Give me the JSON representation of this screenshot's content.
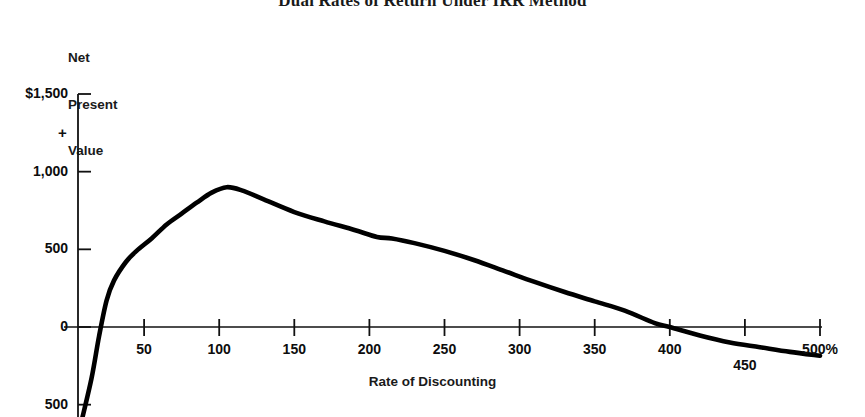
{
  "chart_data": {
    "type": "line",
    "title": "Dual Rates of Return Under IRR Method",
    "subtitle": "",
    "xlabel": "Rate of Discounting",
    "ylabel": "Net Present Value",
    "ylabel_lines": [
      "Net",
      "Present",
      "Value"
    ],
    "xlim": [
      0,
      500
    ],
    "ylim": [
      -600,
      1500
    ],
    "grid": false,
    "legend": null,
    "x_unit": "%",
    "y_unit": "$",
    "xticks": [
      {
        "value": 50,
        "label": "50"
      },
      {
        "value": 100,
        "label": "100"
      },
      {
        "value": 150,
        "label": "150"
      },
      {
        "value": 200,
        "label": "200"
      },
      {
        "value": 250,
        "label": "250"
      },
      {
        "value": 300,
        "label": "300"
      },
      {
        "value": 350,
        "label": "350"
      },
      {
        "value": 400,
        "label": "400"
      },
      {
        "value": 450,
        "label": "450"
      },
      {
        "value": 500,
        "label": "500%"
      }
    ],
    "yticks": [
      {
        "value": 1500,
        "label": "$1,500"
      },
      {
        "value": 1000,
        "label": "1,000"
      },
      {
        "value": 500,
        "label": "500"
      },
      {
        "value": 0,
        "label": "0"
      },
      {
        "value": -500,
        "label": "500"
      }
    ],
    "annotations": [
      {
        "text": "+",
        "value": 1250,
        "note": "positive region marker on y-axis"
      }
    ],
    "series": [
      {
        "name": "Net Present Value",
        "color": "#000000",
        "x": [
          8,
          15,
          20,
          25,
          30,
          38,
          45,
          55,
          65,
          75,
          85,
          95,
          105,
          115,
          130,
          150,
          170,
          190,
          205,
          215,
          230,
          250,
          270,
          290,
          310,
          330,
          350,
          370,
          390,
          400,
          420,
          440,
          460,
          480,
          500
        ],
        "y": [
          -620,
          -330,
          -60,
          170,
          300,
          420,
          490,
          570,
          660,
          730,
          800,
          865,
          900,
          880,
          820,
          740,
          680,
          625,
          580,
          570,
          540,
          490,
          430,
          360,
          290,
          225,
          165,
          105,
          25,
          0,
          -55,
          -100,
          -130,
          -160,
          -185
        ]
      }
    ],
    "zero_crossings": [
      20,
      395
    ],
    "peak": {
      "x": 105,
      "y": 900
    }
  }
}
